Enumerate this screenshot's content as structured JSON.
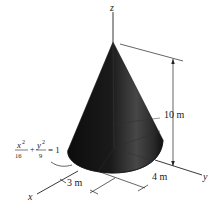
{
  "figure": {
    "type": "elliptic-cone-diagram",
    "axes": {
      "z_label": "z",
      "y_label": "y",
      "x_label": "x"
    },
    "dimensions": {
      "height_label": "10 m",
      "semi_axis_y_label": "4 m",
      "semi_axis_x_label": "3 m"
    },
    "base_equation": {
      "term1_num": "x",
      "term1_exp": "2",
      "term1_den": "16",
      "plus": "+",
      "term2_num": "y",
      "term2_exp": "2",
      "term2_den": "9",
      "equals": "= 1"
    },
    "colors": {
      "cone_dark": "#0e0e0e",
      "cone_light": "#4a4a4a",
      "line": "#222222",
      "background": "#ffffff"
    }
  }
}
